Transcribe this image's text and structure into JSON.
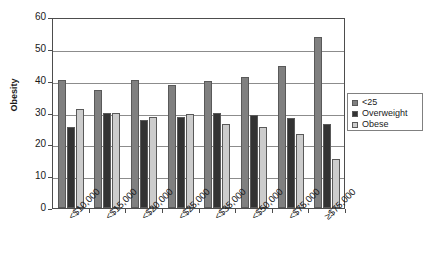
{
  "chart_data": {
    "type": "bar",
    "title": "",
    "subtitle": "",
    "xlabel": "",
    "ylabel": "Obesity",
    "ylim": [
      0,
      60
    ],
    "yticks": [
      "0",
      "10",
      "20",
      "30",
      "40",
      "50",
      "60"
    ],
    "grid": true,
    "legend_position": "right",
    "categories": [
      "<$10,000",
      "<$15,000",
      "<$20,000",
      "<$25,000",
      "<$35,000",
      "<$50,000",
      "<$75,000",
      "≥$75,000"
    ],
    "series": [
      {
        "name": "<25",
        "color": "#808080",
        "values": [
          40.1,
          37.0,
          40.2,
          38.5,
          39.9,
          41.2,
          44.5,
          53.8
        ]
      },
      {
        "name": "Overweight",
        "color": "#333333",
        "values": [
          25.3,
          29.8,
          27.7,
          28.6,
          29.9,
          29.3,
          28.3,
          26.4
        ]
      },
      {
        "name": "Obese",
        "color": "#cccccc",
        "values": [
          31.1,
          30.0,
          28.5,
          29.6,
          26.5,
          25.6,
          23.2,
          15.4
        ]
      }
    ]
  },
  "legend": {
    "items": [
      {
        "label": "<25",
        "color": "#808080"
      },
      {
        "label": "Overweight",
        "color": "#333333"
      },
      {
        "label": "Obese",
        "color": "#cccccc"
      }
    ]
  }
}
